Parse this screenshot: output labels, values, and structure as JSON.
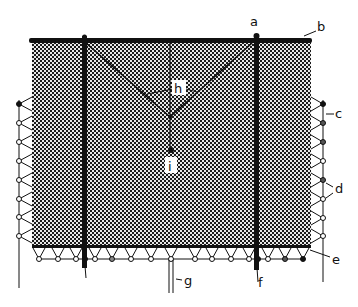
{
  "figure": {
    "colors": {
      "ink": "#111111",
      "net_fill": "#5a5a5a",
      "background": "#ffffff"
    },
    "labels": {
      "a": "a",
      "b": "b",
      "c": "c",
      "d": "d",
      "e": "e",
      "f": "f",
      "g": "g",
      "h": "h",
      "i": "i"
    }
  }
}
